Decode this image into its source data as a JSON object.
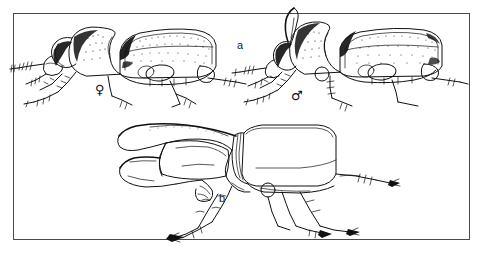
{
  "figure": {
    "background_color": "#ffffff",
    "frame_color": "#4a4a4a",
    "ink_color": "#111111",
    "panels": [
      {
        "id": "a",
        "label": "a",
        "caption_label": "a",
        "description": "Lateral view of a sexually dimorphic scarab beetle pair",
        "subjects": [
          {
            "name": "female-beetle",
            "sex_symbol": "♀",
            "sex": "female",
            "position": "left",
            "has_horn": false
          },
          {
            "name": "male-beetle",
            "sex_symbol": "♂",
            "sex": "male",
            "position": "right",
            "has_horn": true
          }
        ]
      },
      {
        "id": "b",
        "label": "b",
        "caption_label": "b",
        "description": "Lateral view of a large horned hercules beetle male",
        "subjects": [
          {
            "name": "hercules-beetle",
            "sex": "male",
            "position": "center",
            "has_horn": true
          }
        ]
      }
    ]
  },
  "labels": {
    "panel_a": "a",
    "panel_b": "b",
    "female_symbol": "♀",
    "male_symbol": "♂"
  }
}
